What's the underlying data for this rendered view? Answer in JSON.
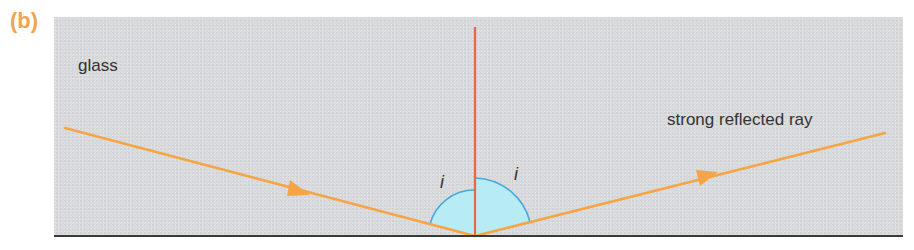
{
  "figure": {
    "label": "(b)",
    "medium_label": "glass",
    "reflected_ray_label": "strong reflected ray",
    "angle_incidence_label": "i",
    "angle_reflection_label": "i"
  },
  "colors": {
    "figure_label": "#f0a450",
    "ray": "#f5a545",
    "normal": "#e8664a",
    "angle_fill": "#b8ecf5",
    "angle_stroke": "#4aa8d8",
    "panel": "#d9dadc",
    "boundary": "#3a3a3a",
    "text": "#333333"
  },
  "geometry": {
    "incidence_point": [
      475,
      236
    ],
    "incident_ray_start": [
      65,
      128
    ],
    "reflected_ray_end": [
      885,
      133
    ],
    "normal_top": [
      475,
      27
    ]
  }
}
